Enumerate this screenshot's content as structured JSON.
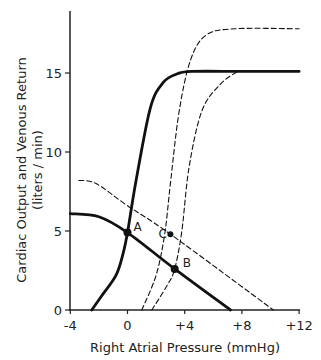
{
  "chart_data": {
    "type": "line",
    "title": "",
    "xlabel": "Right Atrial Pressure (mmHg)",
    "ylabel": "Cardiac Output and Venous Return",
    "ylabel_units": "(liters / min)",
    "xlim": [
      -4,
      12
    ],
    "ylim": [
      0,
      18
    ],
    "xticks": [
      -4,
      0,
      4,
      8,
      12
    ],
    "xtick_labels": [
      "-4",
      "0",
      "+4",
      "+8",
      "+12"
    ],
    "yticks": [
      0,
      5,
      10,
      15
    ],
    "ytick_labels": [
      "0",
      "5",
      "10",
      "15"
    ],
    "grid": false,
    "legend": null,
    "series": [
      {
        "name": "Normal cardiac output curve",
        "style": "solid-thick",
        "x": [
          -2.5,
          -1.8,
          -0.8,
          -0.3,
          0,
          0.6,
          1.6,
          2.5,
          3.5,
          4.5,
          8,
          12
        ],
        "y": [
          0,
          0.9,
          2.2,
          3.6,
          4.9,
          8.2,
          12.8,
          14.4,
          14.95,
          15.1,
          15.1,
          15.1
        ]
      },
      {
        "name": "Normal venous return curve",
        "style": "solid-thick",
        "x": [
          -4,
          -2,
          0,
          3.3,
          7.2
        ],
        "y": [
          6.1,
          5.9,
          4.9,
          2.6,
          0
        ]
      },
      {
        "name": "Increased venous return curve",
        "style": "dashed",
        "x": [
          -3.4,
          -2.2,
          0,
          3.0,
          10.2
        ],
        "y": [
          8.2,
          8.0,
          6.6,
          4.8,
          0
        ]
      },
      {
        "name": "Shifted cardiac output curve (upper plateau)",
        "style": "dashed",
        "x": [
          1.0,
          2.0,
          2.6,
          3.0,
          3.6,
          4.4,
          5.5,
          7.5,
          12
        ],
        "y": [
          0,
          2.2,
          4.8,
          8.0,
          12.5,
          15.8,
          17.4,
          17.8,
          17.8
        ]
      },
      {
        "name": "Shifted cardiac output curve (normal plateau)",
        "style": "dashed",
        "x": [
          1.7,
          2.8,
          3.3,
          3.8,
          4.3,
          5.2,
          6.5,
          7.7
        ],
        "y": [
          0,
          1.6,
          2.6,
          5.0,
          9.0,
          12.6,
          14.3,
          15.1
        ]
      }
    ],
    "annotations": [
      {
        "label": "A",
        "x": 0,
        "y": 4.9
      },
      {
        "label": "B",
        "x": 3.3,
        "y": 2.6
      },
      {
        "label": "C",
        "x": 3.0,
        "y": 4.8
      }
    ]
  }
}
